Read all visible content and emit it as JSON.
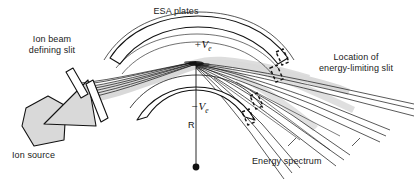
{
  "figure": {
    "type": "schematic-diagram",
    "background_color": "#ffffff",
    "line_color": "#111111",
    "beam_fill_color": "#d9d9d9",
    "source_fill_color": "#d9d9d9",
    "width": 414,
    "height": 179
  },
  "labels": {
    "esa_plates": "ESA plates",
    "upper_plate_voltage_sign": "+",
    "upper_plate_voltage_symbol": "V",
    "upper_plate_voltage_subscript": "e",
    "lower_plate_voltage_sign": "−",
    "lower_plate_voltage_symbol": "V",
    "lower_plate_voltage_subscript": "e",
    "radius": "R",
    "ion_beam_defining_slit_line1": "Ion beam",
    "ion_beam_defining_slit_line2": "defining slit",
    "ion_source": "Ion source",
    "energy_limiting_slit_line1": "Location of",
    "energy_limiting_slit_line2": "energy-limiting slit",
    "energy_spectrum": "Energy spectrum"
  },
  "components": {
    "upper_esa_plate": "curved arc band, concave down, positive potential",
    "lower_esa_plate": "curved arc band, concave up, negative potential",
    "radius_line": "vertical line from arc centre dot up to beam focus",
    "centre_dot": "filled circle marking centre of curvature",
    "ion_source_body": "grey pentagon",
    "extraction_wedge": "grey triangular arrow pointing left into source",
    "defining_slit_jaw_upper": "narrow outlined bar",
    "defining_slit_jaw_lower": "narrow outlined bar",
    "energy_limiting_slit_jaws_upper": "dashed outlined slit jaw pair",
    "energy_limiting_slit_jaws_lower": "dashed outlined slit jaw pair",
    "beam_envelope": "grey shaded ion beam band through analyzer",
    "ray_fan": "dispersed ray bundles forming energy spectrum"
  }
}
